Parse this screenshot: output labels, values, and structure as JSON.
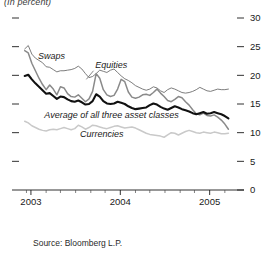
{
  "figure": {
    "unit_note": "(In percent)",
    "source": "Source: Bloomberg L.P."
  },
  "labels": {
    "swaps": "Swaps",
    "equities": "Equities",
    "average": "Average of all three asset classes",
    "currencies": "Currencies"
  },
  "chart_data": {
    "type": "line",
    "title": "",
    "subtitle": "(In percent)",
    "xlabel": "",
    "ylabel": "",
    "ylim": [
      0,
      30
    ],
    "xlim": [
      2002.9,
      2005.25
    ],
    "grid": false,
    "legend": "inline-annotations",
    "yticks": [
      0,
      5,
      10,
      15,
      20,
      25,
      30
    ],
    "ytick_labels": [
      "0",
      "5",
      "10",
      "15",
      "20",
      "25",
      "30"
    ],
    "xticks": [
      2003,
      2004,
      2005
    ],
    "xtick_labels": [
      "2003",
      "2004",
      "2005"
    ],
    "x_minor_ticks": [
      2002.95,
      2003.17,
      2003.33,
      2003.5,
      2003.67,
      2003.83,
      2004.17,
      2004.33,
      2004.5,
      2004.67,
      2004.83,
      2005.17
    ],
    "colors": {
      "swaps": "#6e6e6e",
      "equities": "#8a8a8a",
      "average": "#111111",
      "currencies": "#c9c9c9"
    },
    "series": [
      {
        "name": "Swaps",
        "color": "#6e6e6e",
        "width": 0.9,
        "x": [
          2002.93,
          2002.97,
          2003.01,
          2003.05,
          2003.09,
          2003.13,
          2003.17,
          2003.21,
          2003.25,
          2003.29,
          2003.33,
          2003.37,
          2003.41,
          2003.45,
          2003.49,
          2003.53,
          2003.57,
          2003.61,
          2003.65,
          2003.69,
          2003.73,
          2003.77,
          2003.81,
          2003.85,
          2003.89,
          2003.93,
          2003.97,
          2004.01,
          2004.05,
          2004.09,
          2004.13,
          2004.17,
          2004.21,
          2004.25,
          2004.29,
          2004.33,
          2004.37,
          2004.41,
          2004.45,
          2004.49,
          2004.53,
          2004.57,
          2004.61,
          2004.65,
          2004.69,
          2004.73,
          2004.77,
          2004.81,
          2004.85,
          2004.89,
          2004.93,
          2004.97,
          2005.01,
          2005.05,
          2005.09,
          2005.13,
          2005.17,
          2005.21
        ],
        "values": [
          24.6,
          25.2,
          23.7,
          23.0,
          22.6,
          22.2,
          21.5,
          21.4,
          21.0,
          20.6,
          20.8,
          20.8,
          20.9,
          21.0,
          21.2,
          21.6,
          21.1,
          20.3,
          19.6,
          19.8,
          20.3,
          20.9,
          20.7,
          20.5,
          20.9,
          21.1,
          20.5,
          19.9,
          19.4,
          19.1,
          18.7,
          18.2,
          17.9,
          17.6,
          17.4,
          17.6,
          18.0,
          17.8,
          17.3,
          17.0,
          17.5,
          17.8,
          17.6,
          17.3,
          17.0,
          16.9,
          17.0,
          17.2,
          17.5,
          17.9,
          17.6,
          17.3,
          17.2,
          17.4,
          17.6,
          17.5,
          17.5,
          17.6
        ]
      },
      {
        "name": "Equities",
        "color": "#8a8a8a",
        "width": 1.5,
        "x": [
          2002.93,
          2002.97,
          2003.01,
          2003.05,
          2003.09,
          2003.13,
          2003.17,
          2003.21,
          2003.25,
          2003.29,
          2003.33,
          2003.37,
          2003.41,
          2003.45,
          2003.49,
          2003.53,
          2003.57,
          2003.61,
          2003.65,
          2003.69,
          2003.73,
          2003.77,
          2003.81,
          2003.85,
          2003.89,
          2003.93,
          2003.97,
          2004.01,
          2004.05,
          2004.09,
          2004.13,
          2004.17,
          2004.21,
          2004.25,
          2004.29,
          2004.33,
          2004.37,
          2004.41,
          2004.45,
          2004.49,
          2004.53,
          2004.57,
          2004.61,
          2004.65,
          2004.69,
          2004.73,
          2004.77,
          2004.81,
          2004.85,
          2004.89,
          2004.93,
          2004.97,
          2005.01,
          2005.05,
          2005.09,
          2005.13,
          2005.17,
          2005.21
        ],
        "values": [
          24.3,
          23.9,
          22.1,
          20.8,
          19.5,
          18.4,
          17.5,
          18.3,
          17.6,
          16.6,
          18.0,
          17.8,
          16.8,
          16.3,
          16.2,
          16.6,
          16.0,
          15.4,
          15.9,
          17.2,
          20.3,
          19.5,
          17.5,
          16.6,
          16.3,
          16.5,
          17.6,
          19.3,
          18.9,
          17.1,
          16.2,
          16.0,
          16.2,
          16.6,
          16.7,
          16.5,
          17.0,
          17.6,
          16.9,
          16.3,
          15.6,
          15.4,
          15.8,
          16.3,
          16.1,
          15.4,
          14.8,
          14.0,
          13.3,
          13.1,
          13.4,
          13.0,
          12.9,
          13.1,
          12.7,
          12.2,
          11.5,
          10.6
        ]
      },
      {
        "name": "Average of all three asset classes",
        "color": "#111111",
        "width": 2.1,
        "x": [
          2002.93,
          2002.97,
          2003.01,
          2003.05,
          2003.09,
          2003.13,
          2003.17,
          2003.21,
          2003.25,
          2003.29,
          2003.33,
          2003.37,
          2003.41,
          2003.45,
          2003.49,
          2003.53,
          2003.57,
          2003.61,
          2003.65,
          2003.69,
          2003.73,
          2003.77,
          2003.81,
          2003.85,
          2003.89,
          2003.93,
          2003.97,
          2004.01,
          2004.05,
          2004.09,
          2004.13,
          2004.17,
          2004.21,
          2004.25,
          2004.29,
          2004.33,
          2004.37,
          2004.41,
          2004.45,
          2004.49,
          2004.53,
          2004.57,
          2004.61,
          2004.65,
          2004.69,
          2004.73,
          2004.77,
          2004.81,
          2004.85,
          2004.89,
          2004.93,
          2004.97,
          2005.01,
          2005.05,
          2005.09,
          2005.13,
          2005.17,
          2005.21
        ],
        "values": [
          19.9,
          20.1,
          19.3,
          18.6,
          18.0,
          17.4,
          16.8,
          16.9,
          16.4,
          15.9,
          16.3,
          16.2,
          15.8,
          15.5,
          15.4,
          15.6,
          15.3,
          14.9,
          15.0,
          15.5,
          16.7,
          16.3,
          15.5,
          15.1,
          15.0,
          15.1,
          15.4,
          15.2,
          15.0,
          14.6,
          14.3,
          14.1,
          14.2,
          14.3,
          14.4,
          14.8,
          15.1,
          14.9,
          14.5,
          14.2,
          14.0,
          14.3,
          14.6,
          14.4,
          14.1,
          13.9,
          13.7,
          13.4,
          13.2,
          13.4,
          13.6,
          13.3,
          13.4,
          13.6,
          13.4,
          13.2,
          12.9,
          12.5
        ]
      },
      {
        "name": "Currencies",
        "color": "#c9c9c9",
        "width": 1.5,
        "x": [
          2002.93,
          2002.97,
          2003.01,
          2003.05,
          2003.09,
          2003.13,
          2003.17,
          2003.21,
          2003.25,
          2003.29,
          2003.33,
          2003.37,
          2003.41,
          2003.45,
          2003.49,
          2003.53,
          2003.57,
          2003.61,
          2003.65,
          2003.69,
          2003.73,
          2003.77,
          2003.81,
          2003.85,
          2003.89,
          2003.93,
          2003.97,
          2004.01,
          2004.05,
          2004.09,
          2004.13,
          2004.17,
          2004.21,
          2004.25,
          2004.29,
          2004.33,
          2004.37,
          2004.41,
          2004.45,
          2004.49,
          2004.53,
          2004.57,
          2004.61,
          2004.65,
          2004.69,
          2004.73,
          2004.77,
          2004.81,
          2004.85,
          2004.89,
          2004.93,
          2004.97,
          2005.01,
          2005.05,
          2005.09,
          2005.13,
          2005.17,
          2005.21
        ],
        "values": [
          12.0,
          11.7,
          11.2,
          10.9,
          10.6,
          10.4,
          10.3,
          10.5,
          10.6,
          10.5,
          10.7,
          10.9,
          10.7,
          10.5,
          10.7,
          11.3,
          11.0,
          10.6,
          10.9,
          11.3,
          11.2,
          11.0,
          10.8,
          10.7,
          10.9,
          11.1,
          11.2,
          11.0,
          10.8,
          10.9,
          11.0,
          10.8,
          10.5,
          10.2,
          9.9,
          9.7,
          9.6,
          9.5,
          9.4,
          9.2,
          9.6,
          10.0,
          9.9,
          9.6,
          9.9,
          10.2,
          10.4,
          10.2,
          10.0,
          9.9,
          10.1,
          10.0,
          9.9,
          10.1,
          10.0,
          9.8,
          9.8,
          9.9
        ]
      }
    ],
    "annotations": [
      {
        "text": "Swaps",
        "x": 2003.08,
        "y": 22.9
      },
      {
        "text": "Equities",
        "x": 2003.72,
        "y": 21.2
      },
      {
        "text": "Average of all three asset classes",
        "x": 2003.15,
        "y": 12.6
      },
      {
        "text": "Currencies",
        "x": 2003.55,
        "y": 9.3
      }
    ]
  }
}
